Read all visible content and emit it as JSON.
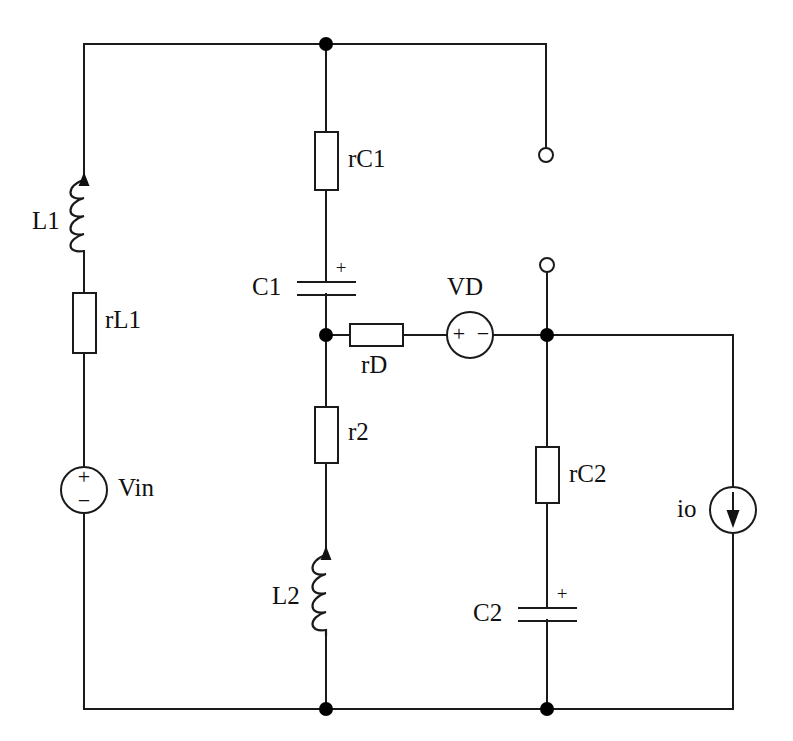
{
  "diagram": {
    "type": "electrical-schematic",
    "background_color": "#ffffff",
    "line_color": "#1a1a1a"
  },
  "labels": {
    "L1": "L1",
    "rL1": "rL1",
    "Vin": "Vin",
    "rC1": "rC1",
    "C1": "C1",
    "rD": "rD",
    "r2": "r2",
    "L2": "L2",
    "VD": "VD",
    "rC2": "rC2",
    "C2": "C2",
    "io": "io"
  },
  "polarity": {
    "plus": "+",
    "minus": "−",
    "cap_plus": "+"
  },
  "components": [
    {
      "name": "L1",
      "kind": "inductor",
      "label": "L1",
      "orientation": "vertical",
      "arrow": "up"
    },
    {
      "name": "rL1",
      "kind": "resistor",
      "label": "rL1",
      "orientation": "vertical"
    },
    {
      "name": "Vin",
      "kind": "voltage-source",
      "label": "Vin",
      "orientation": "vertical",
      "plus": "top",
      "minus": "bottom"
    },
    {
      "name": "rC1",
      "kind": "resistor",
      "label": "rC1",
      "orientation": "vertical"
    },
    {
      "name": "C1",
      "kind": "capacitor",
      "label": "C1",
      "orientation": "vertical",
      "plus": "top"
    },
    {
      "name": "rD",
      "kind": "resistor",
      "label": "rD",
      "orientation": "horizontal"
    },
    {
      "name": "VD",
      "kind": "voltage-source",
      "label": "VD",
      "orientation": "horizontal",
      "plus": "left",
      "minus": "right"
    },
    {
      "name": "r2",
      "kind": "resistor",
      "label": "r2",
      "orientation": "vertical"
    },
    {
      "name": "L2",
      "kind": "inductor",
      "label": "L2",
      "orientation": "vertical",
      "arrow": "up"
    },
    {
      "name": "rC2",
      "kind": "resistor",
      "label": "rC2",
      "orientation": "vertical"
    },
    {
      "name": "C2",
      "kind": "capacitor",
      "label": "C2",
      "orientation": "vertical",
      "plus": "top"
    },
    {
      "name": "io",
      "kind": "current-source",
      "label": "io",
      "orientation": "vertical",
      "arrow": "down"
    }
  ],
  "terminals": [
    {
      "name": "output-terminal-top",
      "shape": "open-circle"
    },
    {
      "name": "output-terminal-middle",
      "shape": "open-circle"
    }
  ],
  "junctions": [
    {
      "name": "node-top-rail"
    },
    {
      "name": "node-c1-rd"
    },
    {
      "name": "node-vd-output"
    },
    {
      "name": "node-bottom-left"
    },
    {
      "name": "node-bottom-right"
    }
  ]
}
